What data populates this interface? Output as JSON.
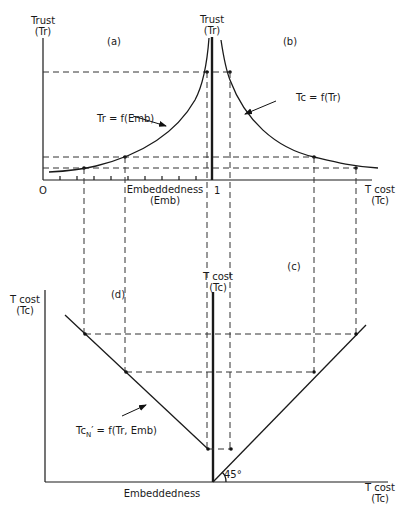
{
  "panels": {
    "a": {
      "label": "(a)",
      "curve_label": "Tr = f(Emb)"
    },
    "b": {
      "label": "(b)",
      "curve_label": "Tc = f(Tr)"
    },
    "c": {
      "label": "(c)"
    },
    "d": {
      "label": "(d)",
      "curve_label_main": "Tc",
      "curve_label_sub": "N",
      "curve_label_rest": "′ = f(Tr, Emb)"
    }
  },
  "axes": {
    "top_left_y": {
      "line1": "Trust",
      "line2": "(Tr)"
    },
    "top_center_y": {
      "line1": "Trust",
      "line2": "(Tr)"
    },
    "top_x_origin": "O",
    "top_x_emb": {
      "line1": "Embeddedness",
      "line2": "(Emb)"
    },
    "top_x_one": "1",
    "top_x_tcost": {
      "line1": "T cost",
      "line2": "(Tc)"
    },
    "bottom_left_y": {
      "line1": "T cost",
      "line2": "(Tc)"
    },
    "bottom_center_y": {
      "line1": "T cost",
      "line2": "(Tc)"
    },
    "bottom_x_emb": "Embeddedness",
    "bottom_x_tcost": {
      "line1": "T cost",
      "line2": "(Tc)"
    },
    "angle": "45°"
  },
  "colors": {
    "ink": "#1a1a1a",
    "background": "#ffffff"
  }
}
